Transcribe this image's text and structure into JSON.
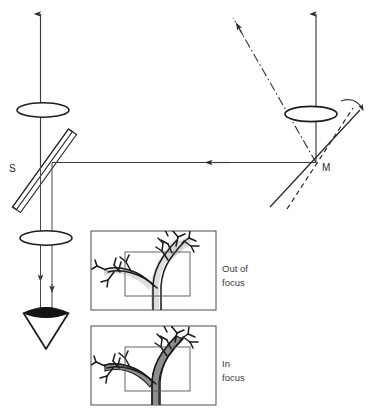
{
  "figure": {
    "type": "optical-ray-diagram",
    "background_color": "#ffffff",
    "line_color": "#3a3a3a",
    "ink_color": "#1a1a1a"
  },
  "labels": {
    "beam_splitter": "S",
    "mirror": "M"
  },
  "panels": [
    {
      "id": "panel-out-of-focus",
      "caption_line1": "Out of",
      "caption_line2": "focus",
      "state": "blurred",
      "blur_color": "#c9c9c9"
    },
    {
      "id": "panel-in-focus",
      "caption_line1": "In",
      "caption_line2": "focus",
      "state": "sharp",
      "fill_color": "#8e8e8e"
    }
  ],
  "optical_elements": [
    {
      "name": "lens-upper-left",
      "kind": "lens",
      "shape": "ellipse"
    },
    {
      "name": "lens-lower-left",
      "kind": "lens",
      "shape": "ellipse"
    },
    {
      "name": "lens-right",
      "kind": "lens",
      "shape": "ellipse"
    },
    {
      "name": "beam-splitter",
      "kind": "beam-splitter",
      "shape": "tilted-slab"
    },
    {
      "name": "mirror",
      "kind": "mirror",
      "shape": "tilted-line"
    },
    {
      "name": "mirror-alternate",
      "kind": "mirror",
      "shape": "dashed-tilted-line"
    },
    {
      "name": "eye",
      "kind": "observer",
      "shape": "funnel"
    }
  ],
  "rays": [
    {
      "name": "ray-left-vertical-up",
      "style": "solid",
      "arrow": "up"
    },
    {
      "name": "ray-right-vertical-up",
      "style": "solid",
      "arrow": "up"
    },
    {
      "name": "ray-diagonal-incoming",
      "style": "dash-dot",
      "arrow": "down-left"
    },
    {
      "name": "ray-horizontal-beam",
      "style": "solid",
      "arrow": "left"
    },
    {
      "name": "ray-to-eye-a",
      "style": "solid",
      "arrow": "down"
    },
    {
      "name": "ray-to-eye-b",
      "style": "solid",
      "arrow": "down"
    }
  ],
  "annotations": {
    "rotation_arrow": "mirror-rotation-arc"
  }
}
